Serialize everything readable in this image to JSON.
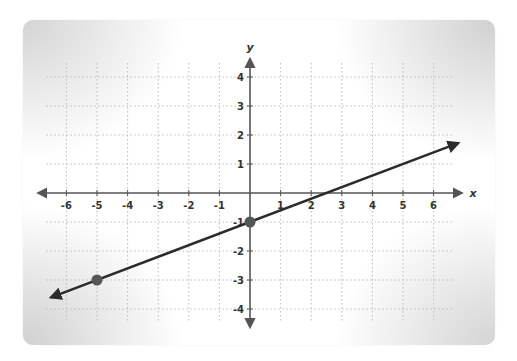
{
  "chart_data": {
    "type": "line",
    "title": "",
    "xlabel": "x",
    "ylabel": "y",
    "xlim": [
      -6,
      6
    ],
    "ylim": [
      -4,
      4
    ],
    "grid": true,
    "grid_style": "dotted",
    "x_ticks": [
      -6,
      -5,
      -4,
      -3,
      -2,
      -1,
      1,
      2,
      3,
      4,
      5,
      6
    ],
    "y_ticks": [
      4,
      3,
      2,
      1,
      -1,
      -2,
      -3,
      -4
    ],
    "x_tick_labels": [
      "-6",
      "-5",
      "-4",
      "-3",
      "-2",
      "-1",
      "1",
      "2",
      "3",
      "4",
      "5",
      "6"
    ],
    "y_tick_labels": [
      "4",
      "3",
      "2",
      "1",
      "-1",
      "-2",
      "-3",
      "-4"
    ],
    "series": [
      {
        "name": "line",
        "equation": "y = 0.4x - 1",
        "slope": 0.4,
        "intercept": -1,
        "extends_both_directions": true,
        "x": [
          -6.5,
          6.8
        ],
        "y": [
          -3.6,
          1.72
        ]
      }
    ],
    "points": [
      {
        "x": 0,
        "y": -1
      },
      {
        "x": -5,
        "y": -3
      }
    ],
    "colors": {
      "line": "#2b2b2b",
      "points": "#555555",
      "axis": "#555555",
      "grid": "#bdbdbd"
    }
  }
}
